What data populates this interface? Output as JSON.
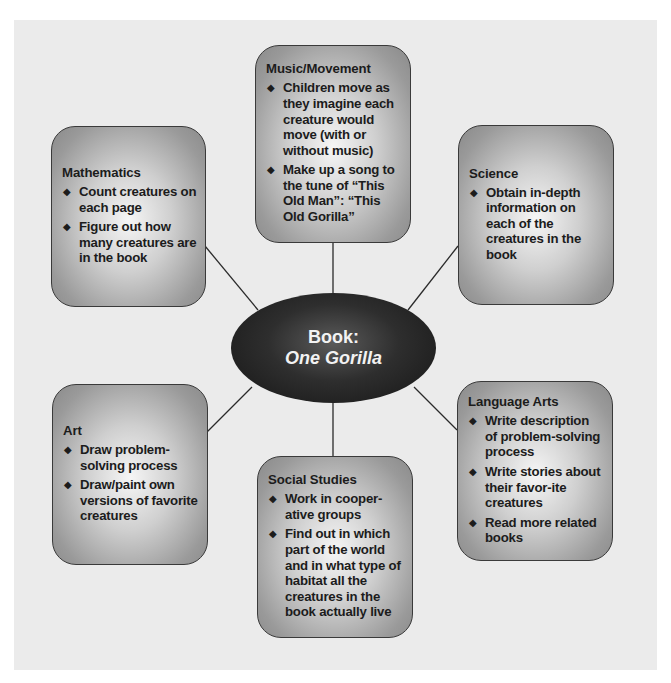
{
  "colors": {
    "panel_background": "#ebebeb",
    "box_border": "#3a3a3a",
    "center_fill": "#1c1c1c",
    "center_text": "#f2f2f2",
    "text": "#1c1c1c"
  },
  "center": {
    "line1": "Book:",
    "line2": "One Gorilla"
  },
  "bullet_icon": "◆",
  "boxes": {
    "music": {
      "title": "Music/Movement",
      "items": [
        "Children move as they imagine each creature would move (with or without music)",
        "Make up a song to the tune of “This Old Man”: “This Old Gorilla”"
      ]
    },
    "math": {
      "title": "Mathematics",
      "items": [
        "Count creatures on each page",
        "Figure out how many creatures are in the book"
      ]
    },
    "science": {
      "title": "Science",
      "items": [
        "Obtain in-depth information on each of the creatures in the book"
      ]
    },
    "art": {
      "title": "Art",
      "items": [
        "Draw problem-solving process",
        "Draw/paint own versions of favorite creatures"
      ]
    },
    "social": {
      "title": "Social Studies",
      "items": [
        "Work in cooper-ative groups",
        "Find out in which part of the world and in what type of habitat all the creatures in the book actually live"
      ]
    },
    "language": {
      "title": "Language Arts",
      "items": [
        "Write description of problem-solving process",
        "Write stories about their favor-ite creatures",
        "Read more related books"
      ]
    }
  }
}
